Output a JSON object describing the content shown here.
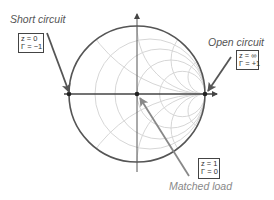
{
  "diagram": {
    "type": "smith-chart",
    "points": [
      {
        "id": "short-circuit",
        "title": "Short circuit",
        "z": "z = 0",
        "gamma": "Γ = −1"
      },
      {
        "id": "open-circuit",
        "title": "Open circuit",
        "z": "z = ∞",
        "gamma": "Γ = +1"
      },
      {
        "id": "matched-load",
        "title": "Matched load",
        "z": "z = 1",
        "gamma": "Γ = 0"
      }
    ]
  },
  "colors": {
    "outer_circle": "#555555",
    "grid": "#d0d0d0",
    "axis": "#444444",
    "arrow": "#555555",
    "matched_arrow": "#777777",
    "text": "#555555",
    "matched_text": "#888888"
  }
}
